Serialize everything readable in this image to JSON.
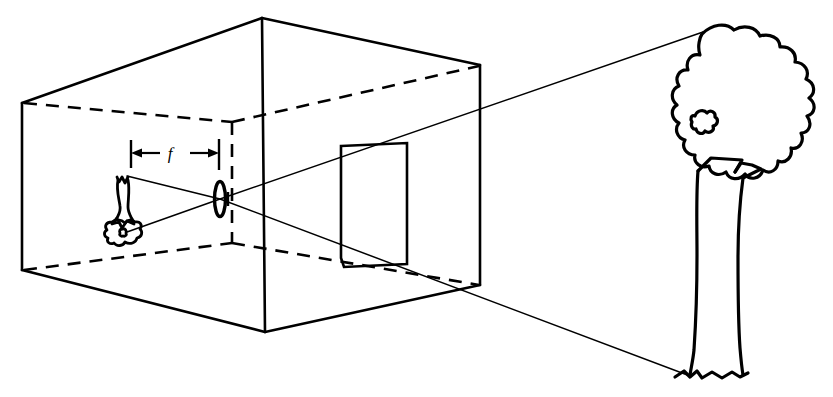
{
  "figure": {
    "kind": "optics-ray-diagram",
    "background_color": "#ffffff",
    "stroke_color": "#000000",
    "width": 833,
    "height": 397
  },
  "labels": {
    "focal_length": "f"
  },
  "parts": {
    "camera_box_name": "camera-box",
    "lens_name": "lens",
    "image_plane_name": "image-plane-panel",
    "inverted_image_name": "inverted-tree-image",
    "object_name": "tree-object",
    "upper_ray_name": "upper-ray",
    "lower_ray_name": "lower-ray",
    "dimension_name": "focal-length-dimension"
  },
  "geometry": {
    "box": {
      "front_top_left": [
        22,
        103
      ],
      "front_bottom_left": [
        22,
        270
      ],
      "top_apex": [
        262,
        18
      ],
      "bottom_apex": [
        265,
        332
      ],
      "back_top_right": [
        480,
        65
      ],
      "back_bottom_right": [
        480,
        285
      ],
      "hidden_top_left": [
        22,
        103
      ],
      "hidden_vertical_x": 232,
      "hidden_vertical_top": 122,
      "hidden_vertical_bottom": 243
    },
    "lens": {
      "cx": 220,
      "cy": 199,
      "rx": 5,
      "ry": 17
    },
    "image_plane_rect": {
      "x": 341,
      "y": 143,
      "w": 66,
      "h": 124
    },
    "focal_dimension": {
      "y": 152,
      "x_left": 130,
      "x_right": 219,
      "tick_top": 140,
      "tick_bottom": 168
    },
    "rays": {
      "upper": [
        [
          700,
          33
        ],
        [
          220,
          199
        ],
        [
          128,
          231
        ]
      ],
      "lower": [
        [
          690,
          375
        ],
        [
          220,
          199
        ],
        [
          128,
          176
        ]
      ]
    },
    "tree": {
      "canopy_center": [
        712,
        150
      ],
      "base": [
        690,
        376
      ]
    }
  }
}
